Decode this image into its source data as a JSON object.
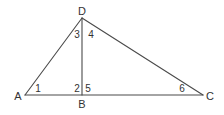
{
  "diagram": {
    "stroke_color": "#4a4a4a",
    "text_color": "#333333",
    "vertices": {
      "A": {
        "label": "A",
        "x": 25,
        "y": 95
      },
      "B": {
        "label": "B",
        "x": 82,
        "y": 95
      },
      "C": {
        "label": "C",
        "x": 203,
        "y": 95
      },
      "D": {
        "label": "D",
        "x": 82,
        "y": 18
      }
    },
    "segments": [
      {
        "name": "AD",
        "from": "A",
        "to": "D"
      },
      {
        "name": "DC",
        "from": "D",
        "to": "C"
      },
      {
        "name": "AC",
        "from": "A",
        "to": "C"
      },
      {
        "name": "DB",
        "from": "D",
        "to": "B"
      }
    ],
    "angles": [
      {
        "label": "1",
        "at": "A"
      },
      {
        "label": "2",
        "at": "B",
        "side": "left"
      },
      {
        "label": "3",
        "at": "D",
        "side": "left"
      },
      {
        "label": "4",
        "at": "D",
        "side": "right"
      },
      {
        "label": "5",
        "at": "B",
        "side": "right"
      },
      {
        "label": "6",
        "at": "C"
      }
    ]
  }
}
